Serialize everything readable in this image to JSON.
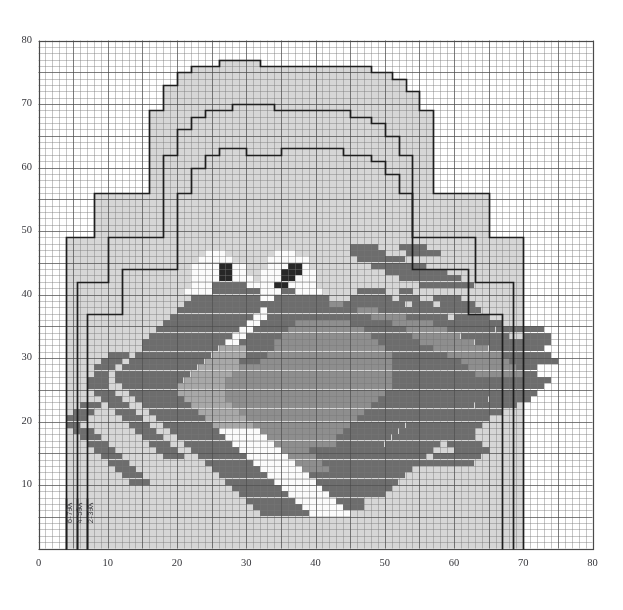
{
  "axes": {
    "x": {
      "min": 0,
      "max": 80,
      "ticks": [
        0,
        10,
        20,
        30,
        40,
        50,
        60,
        70,
        80
      ],
      "label": ""
    },
    "y": {
      "min": 0,
      "max": 80,
      "ticks": [
        10,
        20,
        30,
        40,
        50,
        60,
        70,
        80
      ],
      "label": ""
    }
  },
  "size_labels": [
    {
      "text": "6-7岁",
      "col": 4.2
    },
    {
      "text": "4-5岁",
      "col": 5.7
    },
    {
      "text": "2-3岁",
      "col": 7.3
    }
  ],
  "colors": {
    "background": "#ffffff",
    "grid_minor": "#c9c9c9",
    "grid_major": "#8f8f8f",
    "body_fill": "#d6d6d6",
    "dark_green": "#6d6d6d",
    "mid_green": "#8e8e8e",
    "light_belly": "#a8a8a8",
    "white_eye": "#fbfbfb",
    "pupil": "#272727",
    "outline": "#1d1d1d",
    "axis_text": "#35353a"
  },
  "chart_data": {
    "type": "heatmap",
    "xlabel": "",
    "ylabel": "",
    "xlim": [
      0,
      80
    ],
    "ylim": [
      0,
      80
    ],
    "grid": true,
    "legend": "none",
    "cell_unit": "stitch x row",
    "garment_outlines": [
      {
        "name": "size-2-3",
        "note": "innermost / smallest body outline with neckline",
        "points": [
          [
            7,
            0
          ],
          [
            7,
            37
          ],
          [
            12,
            37
          ],
          [
            12,
            44
          ],
          [
            20,
            44
          ],
          [
            20,
            56
          ],
          [
            22,
            56
          ],
          [
            22,
            60
          ],
          [
            24,
            60
          ],
          [
            24,
            62
          ],
          [
            26,
            62
          ],
          [
            26,
            63
          ],
          [
            30,
            63
          ],
          [
            30,
            62
          ],
          [
            35,
            62
          ],
          [
            35,
            63
          ],
          [
            44,
            63
          ],
          [
            44,
            62
          ],
          [
            48,
            62
          ],
          [
            48,
            61
          ],
          [
            50,
            61
          ],
          [
            50,
            59
          ],
          [
            52,
            59
          ],
          [
            52,
            56
          ],
          [
            54,
            56
          ],
          [
            54,
            44
          ],
          [
            62,
            44
          ],
          [
            62,
            37
          ],
          [
            67,
            37
          ],
          [
            67,
            0
          ]
        ]
      },
      {
        "name": "size-4-5",
        "note": "middle body outline with neckline",
        "points": [
          [
            5.5,
            0
          ],
          [
            5.5,
            42
          ],
          [
            10,
            42
          ],
          [
            10,
            49
          ],
          [
            18,
            49
          ],
          [
            18,
            62
          ],
          [
            20,
            62
          ],
          [
            20,
            66
          ],
          [
            22,
            66
          ],
          [
            22,
            68
          ],
          [
            24,
            68
          ],
          [
            24,
            69
          ],
          [
            28,
            69
          ],
          [
            28,
            70
          ],
          [
            34,
            70
          ],
          [
            34,
            69
          ],
          [
            45,
            69
          ],
          [
            45,
            68
          ],
          [
            48,
            68
          ],
          [
            48,
            67
          ],
          [
            50,
            67
          ],
          [
            50,
            65
          ],
          [
            52,
            65
          ],
          [
            52,
            62
          ],
          [
            54,
            62
          ],
          [
            54,
            49
          ],
          [
            63,
            49
          ],
          [
            63,
            42
          ],
          [
            68.5,
            42
          ],
          [
            68.5,
            0
          ]
        ]
      },
      {
        "name": "size-6-7",
        "note": "outermost body outline with neckline",
        "points": [
          [
            4,
            0
          ],
          [
            4,
            49
          ],
          [
            8,
            49
          ],
          [
            8,
            56
          ],
          [
            16,
            56
          ],
          [
            16,
            69
          ],
          [
            18,
            69
          ],
          [
            18,
            73
          ],
          [
            20,
            73
          ],
          [
            20,
            75
          ],
          [
            22,
            75
          ],
          [
            22,
            76
          ],
          [
            26,
            76
          ],
          [
            26,
            77
          ],
          [
            32,
            77
          ],
          [
            32,
            76
          ],
          [
            48,
            76
          ],
          [
            48,
            75
          ],
          [
            51,
            75
          ],
          [
            51,
            74
          ],
          [
            53,
            74
          ],
          [
            53,
            72
          ],
          [
            55,
            72
          ],
          [
            55,
            69
          ],
          [
            57,
            69
          ],
          [
            57,
            56
          ],
          [
            65,
            56
          ],
          [
            65,
            49
          ],
          [
            70,
            49
          ],
          [
            70,
            0
          ]
        ]
      }
    ],
    "motif": {
      "name": "frog",
      "description": "Pixel-art frog occupying roughly columns 10-72, rows 4-46",
      "palette": {
        "D": "#6d6d6d",
        "M": "#8e8e8e",
        "L": "#a8a8a8",
        "W": "#fbfbfb",
        "K": "#272727"
      }
    }
  }
}
